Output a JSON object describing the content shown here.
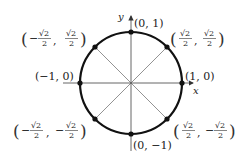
{
  "diagram": {
    "center_px": [
      131,
      83
    ],
    "radius_px": 51,
    "colors": {
      "circle": "#111111",
      "axes": "#555555",
      "diagonals": "#777777",
      "points": "#111111",
      "text": "#222222"
    },
    "axes": {
      "x_label": "x",
      "y_label": "y"
    },
    "points": [
      {
        "name": "point-0-1",
        "label": "(0, 1)"
      },
      {
        "name": "point-1-0",
        "label": "(1, 0)"
      },
      {
        "name": "point-0-neg1",
        "label": "(0, −1)"
      },
      {
        "name": "point-neg1-0",
        "label": "(−1, 0)"
      },
      {
        "name": "point-q1",
        "x_sign": "",
        "y_sign": "",
        "num": "√2",
        "den": "2",
        "comma": ","
      },
      {
        "name": "point-q2",
        "x_sign": "−",
        "y_sign": "",
        "num": "√2",
        "den": "2",
        "comma": ","
      },
      {
        "name": "point-q3",
        "x_sign": "−",
        "y_sign": "−",
        "num": "√2",
        "den": "2",
        "comma": ","
      },
      {
        "name": "point-q4",
        "x_sign": "",
        "y_sign": "−",
        "num": "√2",
        "den": "2",
        "comma": ","
      }
    ],
    "parens": {
      "open": "(",
      "close": ")"
    }
  }
}
